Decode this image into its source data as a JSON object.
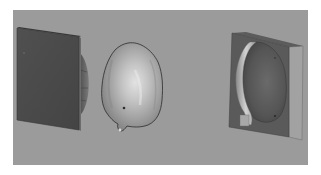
{
  "figure": {
    "background_color": "#ffffff",
    "viewport_color": "#9a9a9a",
    "viewport": {
      "x": 13,
      "y": 10,
      "width": 295,
      "height": 155
    },
    "objects": [
      {
        "id": "left-mold-plate",
        "description": "Flat dark mold plate viewed at an angle with a curved bulge on its back side",
        "front_color": "#4a4a4a",
        "edge_color": "#6e6e6e"
      },
      {
        "id": "bone-implant",
        "description": "Egg-shaped metallic bone/implant piece with dark outline and small protrusion at bottom",
        "base_color": "#a8a8a8",
        "highlight_color": "#d8d8d8",
        "outline_color": "#3a3a3a"
      },
      {
        "id": "right-mold-block",
        "description": "Mold block with oval cavity and raised light rim on its left side",
        "front_color": "#5a5a5a",
        "side_color": "#9c9c9c",
        "cavity_color": "#555555",
        "rim_color": "#c8c8c8"
      }
    ]
  }
}
